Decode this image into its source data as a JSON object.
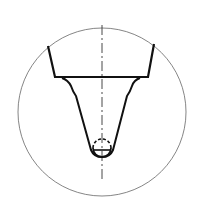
{
  "figure": {
    "type": "technical-drawing",
    "width": 199,
    "height": 215,
    "background": "#ffffff",
    "stroke_color": "#1a1a1a",
    "thin_stroke_color": "#555555",
    "detail_circle": {
      "cx": 102,
      "cy": 112,
      "r": 84
    },
    "centerline": {
      "x": 102,
      "y1": 25,
      "y2": 180,
      "dash": "10 3 2 3"
    },
    "outer_body_path": "M48,46 L55,77 L148,77 L154,44",
    "inner_profile_path": "M62,78 Q68,80 71,86 Q73,92 76,96 L91,150 Q94,157 102,157 Q110,157 113,150 L127,96 Q130,92 132,86 Q134,80 140,78",
    "ball": {
      "cx": 102,
      "cy": 148,
      "r": 9,
      "dash_upper": "3 2"
    },
    "ball_chord_y": 150
  }
}
